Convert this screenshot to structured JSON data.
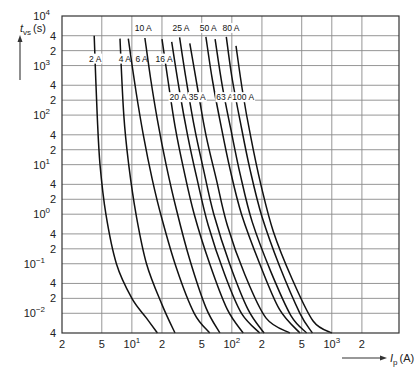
{
  "chart_data": {
    "type": "line",
    "title": "",
    "xlabel": "I_p (A)",
    "ylabel": "t_vs (s)",
    "xscale": "log",
    "yscale": "log",
    "xlim": [
      2,
      4700
    ],
    "ylim": [
      0.004,
      10000
    ],
    "grid": true,
    "x_ticks": [
      {
        "value": 2,
        "label": "2"
      },
      {
        "value": 5,
        "label": "5"
      },
      {
        "value": 10,
        "label": "10",
        "exp": "1"
      },
      {
        "value": 20,
        "label": "2"
      },
      {
        "value": 50,
        "label": "5"
      },
      {
        "value": 100,
        "label": "10",
        "exp": "2"
      },
      {
        "value": 200,
        "label": "2"
      },
      {
        "value": 500,
        "label": "5"
      },
      {
        "value": 1000,
        "label": "10",
        "exp": "3"
      },
      {
        "value": 2000,
        "label": "2"
      }
    ],
    "y_ticks": [
      {
        "value": 10000,
        "label": "10",
        "exp": "4"
      },
      {
        "value": 4000,
        "label": "4"
      },
      {
        "value": 2000,
        "label": "2"
      },
      {
        "value": 1000,
        "label": "10",
        "exp": "3"
      },
      {
        "value": 400,
        "label": "4"
      },
      {
        "value": 200,
        "label": "2"
      },
      {
        "value": 100,
        "label": "10",
        "exp": "2"
      },
      {
        "value": 40,
        "label": "4"
      },
      {
        "value": 20,
        "label": "2"
      },
      {
        "value": 10,
        "label": "10",
        "exp": "1"
      },
      {
        "value": 4,
        "label": "4"
      },
      {
        "value": 2,
        "label": "2"
      },
      {
        "value": 1,
        "label": "10",
        "exp": "0"
      },
      {
        "value": 0.4,
        "label": "4"
      },
      {
        "value": 0.2,
        "label": "2"
      },
      {
        "value": 0.1,
        "label": "10",
        "exp": "−1"
      },
      {
        "value": 0.04,
        "label": "4"
      },
      {
        "value": 0.02,
        "label": "2"
      },
      {
        "value": 0.01,
        "label": "10",
        "exp": "−2"
      },
      {
        "value": 0.004,
        "label": "4"
      }
    ],
    "series": [
      {
        "name": "2 A",
        "label_pos": [
          4.3,
          1200
        ],
        "points": [
          [
            4.2,
            4000
          ],
          [
            4.5,
            100
          ],
          [
            4.8,
            10
          ],
          [
            5.5,
            1
          ],
          [
            7,
            0.1
          ],
          [
            10,
            0.02
          ],
          [
            14,
            0.008
          ],
          [
            18,
            0.004
          ]
        ]
      },
      {
        "name": "4 A",
        "label_pos": [
          8.5,
          1200
        ],
        "points": [
          [
            7.6,
            3500
          ],
          [
            8.3,
            100
          ],
          [
            9.3,
            10
          ],
          [
            11,
            1
          ],
          [
            14,
            0.1
          ],
          [
            20,
            0.015
          ],
          [
            27,
            0.004
          ]
        ]
      },
      {
        "name": "6 A",
        "label_pos": [
          12.5,
          1200
        ],
        "points": [
          [
            9.2,
            3500
          ],
          [
            11,
            300
          ],
          [
            13,
            40
          ],
          [
            16,
            5
          ],
          [
            20,
            0.8
          ],
          [
            28,
            0.08
          ],
          [
            42,
            0.01
          ],
          [
            60,
            0.004
          ]
        ]
      },
      {
        "name": "10 A",
        "label_pos": [
          13,
          5000
        ],
        "points": [
          [
            13.5,
            3600
          ],
          [
            15.5,
            500
          ],
          [
            18,
            80
          ],
          [
            22,
            10
          ],
          [
            28,
            1.2
          ],
          [
            38,
            0.12
          ],
          [
            55,
            0.013
          ],
          [
            76,
            0.004
          ]
        ]
      },
      {
        "name": "16 A",
        "label_pos": [
          21,
          1200
        ],
        "points": [
          [
            20,
            3400
          ],
          [
            23,
            500
          ],
          [
            27,
            60
          ],
          [
            33,
            8
          ],
          [
            42,
            1
          ],
          [
            60,
            0.1
          ],
          [
            90,
            0.012
          ],
          [
            130,
            0.004
          ]
        ]
      },
      {
        "name": "20 A",
        "label_pos": [
          29,
          200
        ],
        "points": [
          [
            25,
            3000
          ],
          [
            30,
            300
          ],
          [
            36,
            40
          ],
          [
            45,
            5
          ],
          [
            58,
            0.6
          ],
          [
            85,
            0.06
          ],
          [
            125,
            0.01
          ],
          [
            190,
            0.004
          ]
        ]
      },
      {
        "name": "25 A",
        "label_pos": [
          31,
          5000
        ],
        "points": [
          [
            30,
            3700
          ],
          [
            35,
            500
          ],
          [
            42,
            60
          ],
          [
            52,
            8
          ],
          [
            66,
            1
          ],
          [
            95,
            0.1
          ],
          [
            145,
            0.012
          ],
          [
            210,
            0.004
          ]
        ]
      },
      {
        "name": "35 A",
        "label_pos": [
          45,
          200
        ],
        "points": [
          [
            38,
            2800
          ],
          [
            46,
            300
          ],
          [
            55,
            40
          ],
          [
            70,
            5
          ],
          [
            90,
            0.6
          ],
          [
            135,
            0.06
          ],
          [
            220,
            0.008
          ],
          [
            380,
            0.004
          ]
        ]
      },
      {
        "name": "50 A",
        "label_pos": [
          58,
          5000
        ],
        "points": [
          [
            55,
            3800
          ],
          [
            64,
            500
          ],
          [
            78,
            60
          ],
          [
            96,
            8
          ],
          [
            125,
            1
          ],
          [
            190,
            0.1
          ],
          [
            300,
            0.012
          ],
          [
            480,
            0.004
          ]
        ]
      },
      {
        "name": "63 A",
        "label_pos": [
          85,
          200
        ],
        "points": [
          [
            68,
            3400
          ],
          [
            80,
            400
          ],
          [
            98,
            50
          ],
          [
            122,
            6
          ],
          [
            160,
            0.7
          ],
          [
            245,
            0.07
          ],
          [
            390,
            0.009
          ],
          [
            560,
            0.004
          ]
        ]
      },
      {
        "name": "80 A",
        "label_pos": [
          98,
          5000
        ],
        "points": [
          [
            88,
            3800
          ],
          [
            100,
            600
          ],
          [
            122,
            70
          ],
          [
            152,
            8
          ],
          [
            200,
            0.9
          ],
          [
            300,
            0.09
          ],
          [
            480,
            0.01
          ],
          [
            640,
            0.004
          ]
        ]
      },
      {
        "name": "100 A",
        "label_pos": [
          130,
          200
        ],
        "points": [
          [
            110,
            2500
          ],
          [
            128,
            300
          ],
          [
            155,
            35
          ],
          [
            195,
            4
          ],
          [
            260,
            0.45
          ],
          [
            400,
            0.05
          ],
          [
            650,
            0.007
          ],
          [
            1000,
            0.004
          ]
        ]
      }
    ]
  },
  "axes": {
    "y_title": "t",
    "y_sub": "vs",
    "y_unit": "(s)",
    "x_title": "I",
    "x_sub": "p",
    "x_unit": "(A)"
  }
}
